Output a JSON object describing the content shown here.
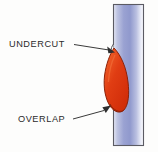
{
  "figure": {
    "background_color": "#fdfdfc",
    "width": 158,
    "height": 152
  },
  "plate": {
    "name": "base-metal-plate",
    "x": 113,
    "y": 4,
    "width": 31,
    "height": 142,
    "outline_color": "#5b5b63",
    "gradient_stops": [
      "#e8e9f6",
      "#9fa6d4",
      "#8e98cf",
      "#c9cde8",
      "#f2f3fa"
    ]
  },
  "weld_bead": {
    "name": "weld-bead",
    "fill_color": "#dd3410",
    "highlight_color": "#ef5a26",
    "outline_color": "#8c2108",
    "top_y": 48,
    "bottom_y": 113,
    "leftmost_x": 104
  },
  "annotations": [
    {
      "id": "undercut",
      "label": "UNDERCUT",
      "text_x": 9,
      "text_y": 47,
      "leader_from_x": 74,
      "leader_from_y": 44,
      "leader_to_x": 110,
      "leader_to_y": 50,
      "arrow_tip_x": 115,
      "arrow_tip_y": 52
    },
    {
      "id": "overlap",
      "label": "OVERLAP",
      "text_x": 18,
      "text_y": 122,
      "leader_from_x": 73,
      "leader_from_y": 119,
      "leader_to_x": 105,
      "leader_to_y": 110,
      "arrow_tip_x": 111,
      "arrow_tip_y": 106
    }
  ]
}
